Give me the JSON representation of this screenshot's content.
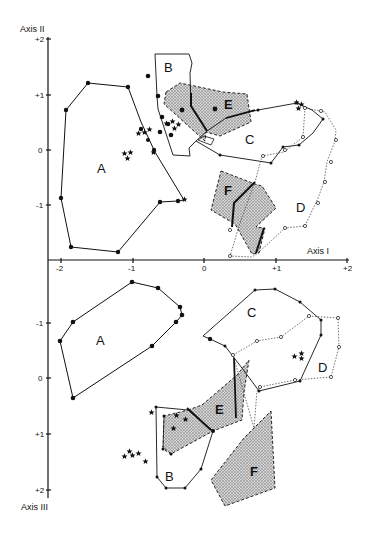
{
  "figure": {
    "top_panel": {
      "x_axis": {
        "label": "Axis I",
        "ticks": [
          "-2",
          "-1",
          "0",
          "+1",
          "+2"
        ]
      },
      "y_axis": {
        "label": "Axis II",
        "ticks": [
          "+2",
          "+1",
          "0",
          "-1"
        ]
      },
      "regions": [
        {
          "id": "A",
          "label": "A",
          "shaded": false
        },
        {
          "id": "B",
          "label": "B",
          "shaded": false
        },
        {
          "id": "C",
          "label": "C",
          "shaded": false
        },
        {
          "id": "D",
          "label": "D",
          "shaded": false
        },
        {
          "id": "E",
          "label": "E",
          "shaded": true
        },
        {
          "id": "F",
          "label": "F",
          "shaded": true
        }
      ]
    },
    "bottom_panel": {
      "y_axis": {
        "label": "Axis III",
        "ticks": [
          "-1",
          "0",
          "+1",
          "+2"
        ]
      },
      "regions": [
        {
          "id": "A",
          "label": "A",
          "shaded": false
        },
        {
          "id": "B",
          "label": "B",
          "shaded": false
        },
        {
          "id": "C",
          "label": "C",
          "shaded": false
        },
        {
          "id": "D",
          "label": "D",
          "shaded": false
        },
        {
          "id": "E",
          "label": "E",
          "shaded": true
        },
        {
          "id": "F",
          "label": "F",
          "shaded": true
        }
      ]
    },
    "colors": {
      "ink": "#111111",
      "shade": "#b8b8b8",
      "background": "#ffffff"
    }
  }
}
